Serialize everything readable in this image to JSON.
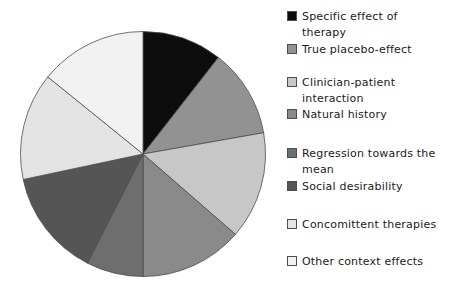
{
  "chart_data": {
    "type": "pie",
    "title": "",
    "legend_position": "right",
    "start_angle_deg": 0,
    "rotation": "clockwise-from-top",
    "outline_color": "#4d4d4d",
    "background_color": "#ffffff",
    "slices": [
      {
        "label": "Specific effect of therapy",
        "label_lines": [
          "Specific effect of",
          "therapy"
        ],
        "angle_deg": 38,
        "value_pct": 10.6,
        "color": "#0d0d0d"
      },
      {
        "label": "True placebo-effect",
        "label_lines": [
          "True placebo-effect"
        ],
        "angle_deg": 42,
        "value_pct": 11.6,
        "color": "#929292"
      },
      {
        "label": "Clinician-patient interaction",
        "label_lines": [
          "Clinician-patient",
          "interaction"
        ],
        "angle_deg": 51,
        "value_pct": 14.2,
        "color": "#c7c7c7"
      },
      {
        "label": "Natural history",
        "label_lines": [
          "Natural history"
        ],
        "angle_deg": 49,
        "value_pct": 13.6,
        "color": "#8a8a8a"
      },
      {
        "label": "Regression towards the mean",
        "label_lines": [
          "Regression towards the",
          "mean"
        ],
        "angle_deg": 27,
        "value_pct": 7.5,
        "color": "#6e6e6e"
      },
      {
        "label": "Social desirability",
        "label_lines": [
          "Social desirability"
        ],
        "angle_deg": 51,
        "value_pct": 14.2,
        "color": "#555555"
      },
      {
        "label": "Concomittent therapies",
        "label_lines": [
          "Concomittent therapies"
        ],
        "angle_deg": 51,
        "value_pct": 14.2,
        "color": "#e3e3e3"
      },
      {
        "label": "Other context effects",
        "label_lines": [
          "Other context effects"
        ],
        "angle_deg": 51,
        "value_pct": 14.1,
        "color": "#f2f2f2"
      }
    ]
  }
}
